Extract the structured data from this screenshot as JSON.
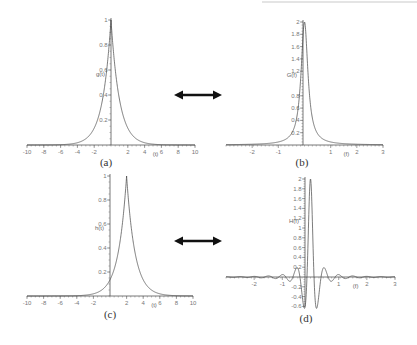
{
  "figure": {
    "arrows": [
      {
        "name": "fourier-pair-arrow-top",
        "x1": 174,
        "x2": 222,
        "y": 95
      },
      {
        "name": "fourier-pair-arrow-bottom",
        "x1": 174,
        "x2": 222,
        "y": 241
      }
    ]
  },
  "chart_data": [
    {
      "panel": "(a)",
      "type": "line",
      "title": "",
      "xlabel": "(t)",
      "ylabel": "g(t)",
      "function": "exp(-|t|)",
      "xlim": [
        -10,
        10
      ],
      "ylim": [
        0,
        1
      ],
      "xticks": [
        -10,
        -8,
        -6,
        -4,
        -2,
        2,
        4,
        6,
        8,
        10
      ],
      "yticks": [
        0.2,
        0.4,
        0.6,
        0.8,
        1
      ],
      "ytick_labels": [
        "0.2",
        "0.4",
        "0.6",
        "0.8",
        "1"
      ],
      "x": [
        -10,
        -6,
        -4,
        -2,
        -1,
        -0.5,
        0,
        0.5,
        1,
        2,
        4,
        6,
        10
      ],
      "y": [
        0.0,
        0.002,
        0.018,
        0.135,
        0.368,
        0.607,
        1.0,
        0.607,
        0.368,
        0.135,
        0.018,
        0.002,
        0.0
      ],
      "layout": {
        "x0": 27,
        "x1": 195,
        "xaxis_y": 145,
        "ytop": 20,
        "yaxis_x": 111
      },
      "grid": false,
      "legend": null
    },
    {
      "panel": "(b)",
      "type": "line",
      "title": "",
      "xlabel": "(f)",
      "ylabel": "G(f)",
      "function": "2/(1+(2*pi*f)^2)",
      "xlim": [
        -3,
        3
      ],
      "ylim": [
        0,
        2
      ],
      "xticks": [
        -2,
        -1,
        1,
        2,
        3
      ],
      "yticks": [
        0.2,
        0.4,
        0.6,
        0.8,
        1.2,
        1.4,
        1.6,
        1.8,
        2
      ],
      "ytick_labels": [
        "0.2",
        "0.4",
        "0.6",
        "0.8",
        "1.2",
        "1.4",
        "1.6",
        "1.8",
        "2"
      ],
      "x": [
        -3,
        -2,
        -1,
        -0.5,
        -0.25,
        -0.1,
        0,
        0.1,
        0.25,
        0.5,
        1,
        2,
        3
      ],
      "y": [
        0.006,
        0.013,
        0.049,
        0.184,
        0.577,
        1.434,
        2.0,
        1.434,
        0.577,
        0.184,
        0.049,
        0.013,
        0.006
      ],
      "layout": {
        "x0": 226,
        "x1": 383,
        "xaxis_y": 145,
        "ytop": 22,
        "yaxis_x": 303
      },
      "grid": false,
      "legend": null
    },
    {
      "panel": "(c)",
      "type": "line",
      "title": "",
      "xlabel": "(t)",
      "ylabel": "h(t)",
      "function": "exp(-|t-2|)",
      "xlim": [
        -10,
        10
      ],
      "ylim": [
        0,
        1
      ],
      "xticks": [
        -10,
        -8,
        -6,
        -4,
        -2,
        2,
        4,
        6,
        8,
        10
      ],
      "yticks": [
        0.2,
        0.4,
        0.6,
        0.8,
        1
      ],
      "ytick_labels": [
        "0.2",
        "0.4",
        "0.6",
        "0.8",
        "1"
      ],
      "x": [
        -4,
        -2,
        0,
        1,
        1.5,
        2,
        2.5,
        3,
        4,
        6,
        8
      ],
      "y": [
        0.002,
        0.018,
        0.135,
        0.368,
        0.607,
        1.0,
        0.607,
        0.368,
        0.135,
        0.018,
        0.002
      ],
      "layout": {
        "x0": 27,
        "x1": 193,
        "xaxis_y": 296,
        "ytop": 176,
        "yaxis_x": 110
      },
      "grid": false,
      "legend": null
    },
    {
      "panel": "(d)",
      "type": "line",
      "title": "",
      "xlabel": "(f)",
      "ylabel": "H(f)",
      "function": "Re{ G(f) * exp(-j*2*pi*f*2) }",
      "xlim": [
        -3,
        3
      ],
      "ylim": [
        -0.6,
        2
      ],
      "xticks": [
        -2,
        -1,
        1,
        2,
        3
      ],
      "yticks": [
        -0.6,
        -0.4,
        -0.2,
        0.2,
        0.4,
        0.6,
        0.8,
        1,
        1.2,
        1.4,
        1.6,
        1.8,
        2
      ],
      "ytick_labels": [
        "-0.6",
        "-0.4",
        "-0.2",
        "0.2",
        "0.4",
        "0.6",
        "0.8",
        "1",
        "1.2",
        "1.4",
        "1.6",
        "1.8",
        "2"
      ],
      "x": [
        -1.0,
        -0.5,
        -0.25,
        -0.1,
        0,
        0.1,
        0.25,
        0.5,
        1.0
      ],
      "y": [
        0.049,
        0.184,
        -0.577,
        0.443,
        2.0,
        0.443,
        -0.577,
        0.184,
        0.049
      ],
      "layout": {
        "x0": 226,
        "x1": 395,
        "xaxis_y": 277,
        "ytop": 179,
        "yaxis_x": 305
      },
      "grid": false,
      "legend": null
    }
  ]
}
